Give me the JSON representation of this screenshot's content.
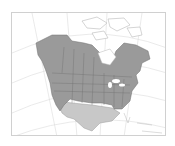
{
  "map": {
    "type": "range-map",
    "region": "North America",
    "legend": [],
    "colors": {
      "background": "#ffffff",
      "land_outline": "#b8b8b8",
      "graticule": "#dcdcdc",
      "range_primary": "#9a9a9a",
      "range_secondary": "#c8c8c8",
      "borders": "#6e6e6e",
      "frame": "#d0d0d0"
    },
    "ranges": [
      {
        "name": "primary-range",
        "description": "Alaska, most of Canada, northern and central United States"
      },
      {
        "name": "secondary-range",
        "description": "southwestern and south-central United States, northern Mexico"
      }
    ]
  }
}
